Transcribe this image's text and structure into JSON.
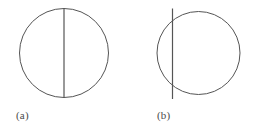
{
  "figure": {
    "background_color": "#ffffff",
    "stroke_color": "#555555",
    "caption_color": "#4a4a4a",
    "stroke_width": 1,
    "panels": [
      {
        "id": "a",
        "caption": "(a)",
        "shape": "circle-with-vertical-diameter",
        "circle": {
          "cx": 64,
          "cy": 53,
          "r": 44.5
        },
        "line": {
          "role": "diameter",
          "x": 64,
          "y_top": 8.5,
          "y_bottom": 97.5,
          "offset_from_center": 0,
          "extends_beyond_circle": false
        }
      },
      {
        "id": "b",
        "caption": "(b)",
        "shape": "circle-with-offset-vertical-chord",
        "circle": {
          "cx": 198.5,
          "cy": 53,
          "r": 41.5
        },
        "line": {
          "role": "chord-secant",
          "x": 172.5,
          "y_top": 8.5,
          "y_bottom": 99,
          "offset_from_center": -26,
          "extends_beyond_circle": true
        }
      }
    ]
  },
  "chart_data": {
    "type": "diagram",
    "title": "",
    "subtitle": "",
    "xlabel": "",
    "ylabel": "",
    "grid": false,
    "legend_position": "none",
    "annotations": [
      "(a)",
      "(b)"
    ],
    "items": [
      {
        "label": "(a)",
        "circle_center_x": 64,
        "circle_center_y": 53,
        "circle_radius": 44.5,
        "line_x": 64,
        "line_offset_from_center": 0,
        "line_type": "diameter"
      },
      {
        "label": "(b)",
        "circle_center_x": 198.5,
        "circle_center_y": 53,
        "circle_radius": 41.5,
        "line_x": 172.5,
        "line_offset_from_center": -26,
        "line_type": "chord"
      }
    ]
  }
}
